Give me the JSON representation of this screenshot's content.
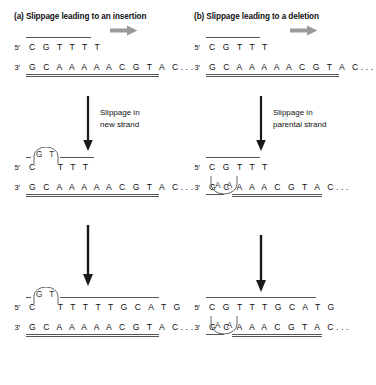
{
  "figure": {
    "title_a": "(a) Slippage leading to an insertion",
    "title_b": "(b) Slippage leading to a deletion",
    "colors": {
      "ink": "#111111",
      "strand_line": "#555555",
      "gray_arrow": "#9a9a9a",
      "black_arrow": "#1a1a1a",
      "loop_stroke": "#666666"
    }
  },
  "labels": {
    "five_prime": "5′",
    "three_prime": "3′"
  },
  "panel_a": {
    "name": "slippage-insertion",
    "title": "(a) Slippage leading to an insertion",
    "process_caption_line1": "Slippage in",
    "process_caption_line2": "new strand",
    "stage1": {
      "top_strand": "C G T T T T",
      "bottom_strand": "G C A A A A A C G T A C...",
      "loop": null
    },
    "stage2": {
      "top_strand_left": "C",
      "top_strand_right": "T T T",
      "bottom_strand": "G C A A A A A C G T A C...",
      "loop_bases": "G T",
      "loop_position": "above-new-strand"
    },
    "stage3": {
      "top_strand_left": "C",
      "top_strand_right": "T T T T T G C A T G",
      "bottom_strand": "G C A A A A A C G T A C...",
      "loop_bases": "G T",
      "loop_position": "above-new-strand"
    }
  },
  "panel_b": {
    "name": "slippage-deletion",
    "title": "(b) Slippage leading to a deletion",
    "process_caption_line1": "Slippage in",
    "process_caption_line2": "parental strand",
    "stage1": {
      "top_strand": "C G T T T",
      "bottom_strand": "G C A A A A A C G T A C...",
      "loop": null
    },
    "stage2": {
      "top_strand": "C G T T T",
      "bottom_strand": "G C A A A C G T A C...",
      "loop_bases": "A A",
      "loop_position": "below-parental-strand"
    },
    "stage3": {
      "top_strand": "C G T T T G C A T G",
      "bottom_strand": "G C A A A C G T A C...",
      "loop_bases": "A A",
      "loop_position": "below-parental-strand"
    }
  },
  "arrows": {
    "top_gray_arrow_a": "replication-direction-arrow",
    "top_gray_arrow_b": "replication-direction-arrow",
    "mid_arrow_a": "slippage-step-arrow",
    "mid_arrow_b": "slippage-step-arrow",
    "lower_arrow_a": "continued-replication-arrow",
    "lower_arrow_b": "continued-replication-arrow"
  }
}
